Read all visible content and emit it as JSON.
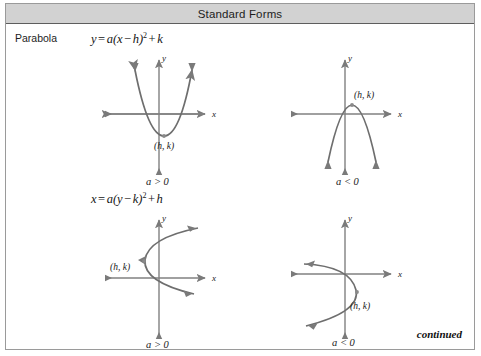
{
  "header": {
    "title": "Standard Forms"
  },
  "row": {
    "label": "Parabola"
  },
  "formulas": {
    "vertical": {
      "lhs": "y",
      "equals": "=",
      "body_a": "a(x",
      "minus": "−",
      "body_h": "h)",
      "exponent": "2",
      "plus": "+",
      "body_k": "k",
      "full": "y = a(x − h)² + k"
    },
    "horizontal": {
      "lhs": "x",
      "equals": "=",
      "body_a": "a(y",
      "minus": "−",
      "body_k": "k)",
      "exponent": "2",
      "plus": "+",
      "body_h": "h",
      "full": "x = a(y − k)² + h"
    }
  },
  "graphs": [
    {
      "id": "top-left",
      "form": "y = a(x − h)² + k",
      "opens": "up",
      "x_axis_label": "x",
      "y_axis_label": "y",
      "vertex_label": "(h, k)",
      "condition_label": "a > 0"
    },
    {
      "id": "top-right",
      "form": "y = a(x − h)² + k",
      "opens": "down",
      "x_axis_label": "x",
      "y_axis_label": "y",
      "vertex_label": "(h, k)",
      "condition_label": "a < 0"
    },
    {
      "id": "bottom-left",
      "form": "x = a(y − k)² + h",
      "opens": "right",
      "x_axis_label": "x",
      "y_axis_label": "y",
      "vertex_label": "(h, k)",
      "condition_label": "a > 0"
    },
    {
      "id": "bottom-right",
      "form": "x = a(y − k)² + h",
      "opens": "left",
      "x_axis_label": "x",
      "y_axis_label": "y",
      "vertex_label": "(h, k)",
      "condition_label": "a < 0"
    }
  ],
  "footer": {
    "continued_label": "continued"
  },
  "colors": {
    "header_band": "#d2d2d2",
    "frame_border": "#9a9a9a",
    "axis_stroke": "#808080",
    "curve_stroke": "#6e6e6e",
    "text": "#1a1a1a",
    "page_background": "#ffffff"
  }
}
